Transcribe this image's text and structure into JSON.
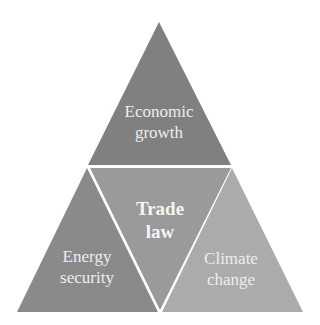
{
  "diagram": {
    "type": "triangle-of-triangles",
    "segments": [
      {
        "id": "top",
        "line1": "Economic",
        "line2": "growth",
        "color": "#808080"
      },
      {
        "id": "left",
        "line1": "Energy",
        "line2": "security",
        "color": "#8a8a8a"
      },
      {
        "id": "center",
        "line1": "Trade",
        "line2": "law",
        "color": "#9a9a9a"
      },
      {
        "id": "right",
        "line1": "Climate",
        "line2": "change",
        "color": "#ababab"
      }
    ]
  }
}
